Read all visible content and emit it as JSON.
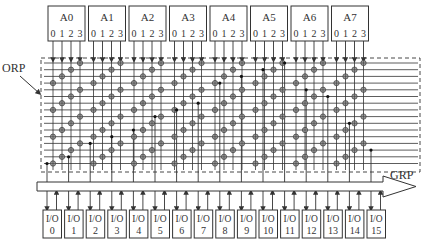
{
  "diagram": {
    "orp_label": "ORP",
    "grp_label": "GRP",
    "blocks": [
      {
        "name": "A0",
        "pins": [
          "0",
          "1",
          "2",
          "3"
        ]
      },
      {
        "name": "A1",
        "pins": [
          "0",
          "1",
          "2",
          "3"
        ]
      },
      {
        "name": "A2",
        "pins": [
          "0",
          "1",
          "2",
          "3"
        ]
      },
      {
        "name": "A3",
        "pins": [
          "0",
          "1",
          "2",
          "3"
        ]
      },
      {
        "name": "A4",
        "pins": [
          "0",
          "1",
          "2",
          "3"
        ]
      },
      {
        "name": "A5",
        "pins": [
          "0",
          "1",
          "2",
          "3"
        ]
      },
      {
        "name": "A6",
        "pins": [
          "0",
          "1",
          "2",
          "3"
        ]
      },
      {
        "name": "A7",
        "pins": [
          "0",
          "1",
          "2",
          "3"
        ]
      }
    ],
    "io_cells": [
      {
        "label": "I/O",
        "index": "0"
      },
      {
        "label": "I/O",
        "index": "1"
      },
      {
        "label": "I/O",
        "index": "2"
      },
      {
        "label": "I/O",
        "index": "3"
      },
      {
        "label": "I/O",
        "index": "4"
      },
      {
        "label": "I/O",
        "index": "5"
      },
      {
        "label": "I/O",
        "index": "6"
      },
      {
        "label": "I/O",
        "index": "7"
      },
      {
        "label": "I/O",
        "index": "8"
      },
      {
        "label": "I/O",
        "index": "9"
      },
      {
        "label": "I/O",
        "index": "10"
      },
      {
        "label": "I/O",
        "index": "11"
      },
      {
        "label": "I/O",
        "index": "12"
      },
      {
        "label": "I/O",
        "index": "13"
      },
      {
        "label": "I/O",
        "index": "14"
      },
      {
        "label": "I/O",
        "index": "15"
      }
    ],
    "colors": {
      "line": "#333333",
      "circle_fill": "#9a9a9a",
      "dot": "#111111"
    }
  }
}
